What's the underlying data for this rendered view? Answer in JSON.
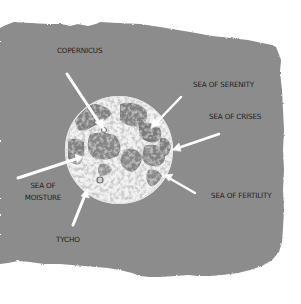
{
  "diagram": {
    "colors": {
      "background": "#ffffff",
      "paper": "#8c8c8c",
      "moon_highlight": "#f4f4f4",
      "maria": "#7d7d7d",
      "arrow": "#ffffff",
      "label_text": "#1e1e1e"
    },
    "labels": [
      {
        "id": "copernicus",
        "text": "COPERNICUS"
      },
      {
        "id": "sea-of-serenity",
        "text": "SEA OF SERENITY"
      },
      {
        "id": "sea-of-crises",
        "text": "SEA OF CRISES"
      },
      {
        "id": "sea-of-fertility",
        "text": "SEA OF FERTILITY"
      },
      {
        "id": "sea-of-moisture",
        "line1": "SEA OF",
        "line2": "MOISTURE"
      },
      {
        "id": "tycho",
        "text": "TYCHO"
      }
    ]
  }
}
